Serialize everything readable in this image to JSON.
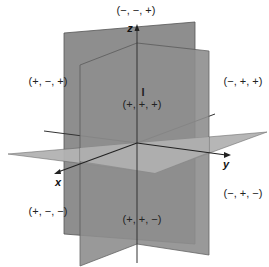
{
  "diagram": {
    "title": "",
    "axes": {
      "x": {
        "label": "x"
      },
      "y": {
        "label": "y"
      },
      "z": {
        "label": "z"
      }
    },
    "colors": {
      "vertical_plane": "#8e8e8e",
      "horizontal_plane": "#b3b3b3",
      "lines": "#333333",
      "background": "#ffffff"
    },
    "octant_marker": "I",
    "octant_labels": [
      {
        "text": "(−, −, +)",
        "x": 136,
        "y": 10
      },
      {
        "text": "(+, −, +)",
        "x": 48,
        "y": 81
      },
      {
        "text": "(−, +, +)",
        "x": 243,
        "y": 81
      },
      {
        "text": "(+, +, +)",
        "x": 142,
        "y": 104
      },
      {
        "text": "(−, +, −)",
        "x": 243,
        "y": 193
      },
      {
        "text": "(+, −, −)",
        "x": 48,
        "y": 211
      },
      {
        "text": "(+, +, −)",
        "x": 142,
        "y": 219
      }
    ]
  }
}
